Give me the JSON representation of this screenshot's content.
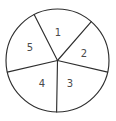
{
  "figure": {
    "background_color": "#ffffff",
    "stroke_color": "#2e2e2e",
    "label_color": "#4a4a4a",
    "width": 116,
    "height": 121
  },
  "circle": {
    "center_x": 57.5,
    "center_y": 60.5,
    "radius": 51.5
  },
  "chart_data": {
    "type": "pie",
    "title": "",
    "xlabel": "",
    "ylabel": "",
    "legend": "none",
    "grid": false,
    "categories": [
      "1",
      "2",
      "3",
      "4",
      "5"
    ],
    "values": [
      68,
      62,
      78,
      76,
      76
    ],
    "units": "degrees",
    "start_angle_deg": -117,
    "direction": "clockwise",
    "slices": [
      {
        "label": "1",
        "start_angle_deg": -117,
        "end_angle_deg": -49,
        "sweep_deg": 68,
        "label_x": 58,
        "label_y": 33
      },
      {
        "label": "2",
        "start_angle_deg": -49,
        "end_angle_deg": 13,
        "sweep_deg": 62,
        "label_x": 84,
        "label_y": 54
      },
      {
        "label": "3",
        "start_angle_deg": 13,
        "end_angle_deg": 91,
        "sweep_deg": 78,
        "label_x": 70,
        "label_y": 84
      },
      {
        "label": "4",
        "start_angle_deg": 91,
        "end_angle_deg": 167,
        "sweep_deg": 76,
        "label_x": 42,
        "label_y": 84
      },
      {
        "label": "5",
        "start_angle_deg": 167,
        "end_angle_deg": 243,
        "sweep_deg": 76,
        "label_x": 30,
        "label_y": 48
      }
    ],
    "dividers": [
      {
        "name": "boundary-5-1",
        "angle_deg": -117,
        "end_x": 34,
        "end_y": 14
      },
      {
        "name": "boundary-1-2",
        "angle_deg": -49,
        "end_x": 89,
        "end_y": 22
      },
      {
        "name": "boundary-2-3",
        "angle_deg": 13,
        "end_x": 107,
        "end_y": 72
      },
      {
        "name": "boundary-3-4",
        "angle_deg": 91,
        "end_x": 56,
        "end_y": 112
      },
      {
        "name": "boundary-4-5",
        "angle_deg": 167,
        "end_x": 7,
        "end_y": 72
      }
    ]
  }
}
